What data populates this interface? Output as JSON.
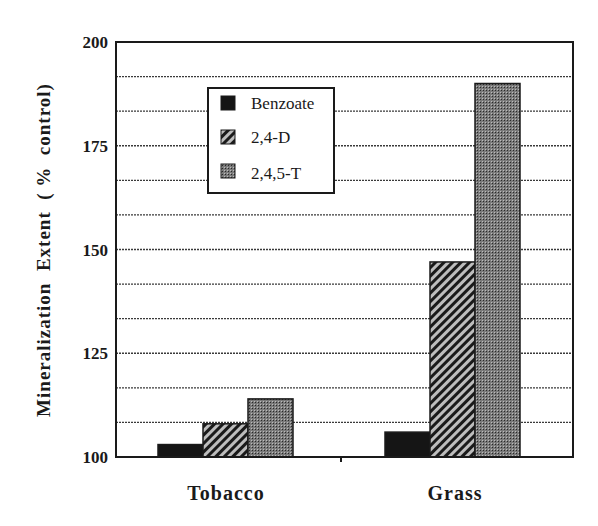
{
  "chart_data": {
    "type": "bar",
    "title": "",
    "xlabel": "",
    "ylabel": "Mineralization  Extent  ( %  control)",
    "ylim": [
      100,
      200
    ],
    "yticks": [
      100,
      125,
      150,
      175,
      200
    ],
    "grid": true,
    "grid_step": 8.333,
    "legend_position": "upper-left-inside",
    "categories": [
      "Tobacco",
      "Grass"
    ],
    "series": [
      {
        "name": "Benzoate",
        "values": [
          103,
          106
        ],
        "pattern": "solid-black"
      },
      {
        "name": "2,4-D",
        "values": [
          108,
          147
        ],
        "pattern": "diagonal-hatch"
      },
      {
        "name": "2,4,5-T",
        "values": [
          114,
          190
        ],
        "pattern": "dense-dots"
      }
    ]
  },
  "labels": {
    "y_axis": "Mineralization  Extent  ( %  control)",
    "yticks": [
      "100",
      "125",
      "150",
      "175",
      "200"
    ],
    "categories": [
      "Tobacco",
      "Grass"
    ],
    "legend": [
      "Benzoate",
      "2,4-D",
      "2,4,5-T"
    ]
  }
}
